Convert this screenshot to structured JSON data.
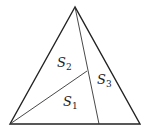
{
  "diagram": {
    "type": "triangle-partition",
    "stroke_color": "#222222",
    "vertices": {
      "apex": [
        75,
        7
      ],
      "bottom_left": [
        10,
        124
      ],
      "bottom_right": [
        140,
        124
      ]
    },
    "cevian_foot": [
      99,
      124
    ],
    "inner_point": [
      87,
      71
    ],
    "regions": [
      {
        "id": "S2",
        "base": "S",
        "sub": "2",
        "pos": [
          65,
          64
        ]
      },
      {
        "id": "S3",
        "base": "S",
        "sub": "3",
        "pos": [
          97,
          83
        ]
      },
      {
        "id": "S1",
        "base": "S",
        "sub": "1",
        "pos": [
          64,
          106
        ]
      }
    ]
  }
}
